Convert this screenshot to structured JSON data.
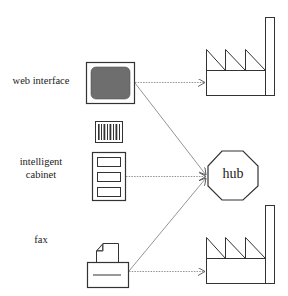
{
  "labels": {
    "web_interface": "web interface",
    "intelligent": "intelligent",
    "cabinet": "cabinet",
    "fax": "fax",
    "hub": "hub"
  },
  "icons": {
    "monitor": "monitor-icon",
    "barcode": "barcode-icon",
    "cabinet": "cabinet-icon",
    "fax": "fax-machine-icon",
    "hub": "octagon-hub",
    "factory_top": "factory-icon",
    "factory_bottom": "factory-icon"
  },
  "connections": [
    {
      "from": "web interface",
      "to": "factory (top)",
      "style": "dotted"
    },
    {
      "from": "web interface",
      "to": "hub",
      "style": "solid-thin"
    },
    {
      "from": "intelligent cabinet",
      "to": "hub",
      "style": "dotted"
    },
    {
      "from": "fax",
      "to": "hub",
      "style": "solid-thin"
    },
    {
      "from": "fax",
      "to": "factory (bottom)",
      "style": "dotted"
    }
  ],
  "colors": {
    "stroke": "#333333",
    "screen_fill": "#6e6e6e",
    "arrow": "#888888"
  }
}
